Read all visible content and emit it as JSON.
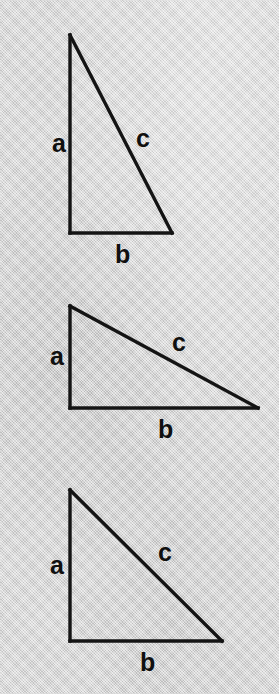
{
  "figure": {
    "kind": "right-triangle-diagram",
    "background_color": "#d7d7d7",
    "stroke_color": "#141414",
    "label_color": "#101010",
    "canvas": {
      "width": 279,
      "height": 694
    },
    "triangles": [
      {
        "id": "triangle-1",
        "name": "tall-narrow-triangle",
        "vertices": {
          "apex": {
            "x": 70,
            "y": 35
          },
          "right_angle": {
            "x": 70,
            "y": 233
          },
          "base_end": {
            "x": 172,
            "y": 233
          }
        },
        "labels": {
          "leg_a": {
            "text": "a",
            "x": 52,
            "y": 131
          },
          "leg_b": {
            "text": "b",
            "x": 115,
            "y": 242
          },
          "hypotenuse_c": {
            "text": "c",
            "x": 136,
            "y": 126
          }
        }
      },
      {
        "id": "triangle-2",
        "name": "wide-shallow-triangle",
        "vertices": {
          "apex": {
            "x": 70,
            "y": 306
          },
          "right_angle": {
            "x": 70,
            "y": 408
          },
          "base_end": {
            "x": 258,
            "y": 408
          }
        },
        "labels": {
          "leg_a": {
            "text": "a",
            "x": 50,
            "y": 344
          },
          "leg_b": {
            "text": "b",
            "x": 158,
            "y": 417
          },
          "hypotenuse_c": {
            "text": "c",
            "x": 172,
            "y": 330
          }
        }
      },
      {
        "id": "triangle-3",
        "name": "isosceles-right-triangle",
        "vertices": {
          "apex": {
            "x": 70,
            "y": 490
          },
          "right_angle": {
            "x": 70,
            "y": 641
          },
          "base_end": {
            "x": 222,
            "y": 641
          }
        },
        "labels": {
          "leg_a": {
            "text": "a",
            "x": 50,
            "y": 553
          },
          "leg_b": {
            "text": "b",
            "x": 140,
            "y": 650
          },
          "hypotenuse_c": {
            "text": "c",
            "x": 158,
            "y": 540
          }
        }
      }
    ]
  }
}
